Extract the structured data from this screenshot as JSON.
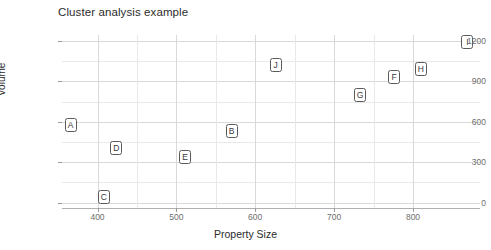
{
  "chart_data": {
    "type": "scatter",
    "title": "Cluster analysis example",
    "xlabel": "Property Size",
    "ylabel": "Volume",
    "xlim": [
      355,
      885
    ],
    "ylim": [
      -40,
      1245
    ],
    "xticks": [
      400,
      500,
      600,
      700,
      800
    ],
    "yticks": [
      0,
      300,
      600,
      900,
      1200
    ],
    "xtick_labels": [
      "400",
      "500",
      "600",
      "700",
      "800"
    ],
    "ytick_labels": [
      "0",
      "300",
      "600",
      "900",
      "1200"
    ],
    "grid": true,
    "legend": "none",
    "marker_style": "boxed-letter",
    "points": [
      {
        "label": "A",
        "x": 366,
        "y": 575
      },
      {
        "label": "B",
        "x": 570,
        "y": 534
      },
      {
        "label": "C",
        "x": 408,
        "y": 42
      },
      {
        "label": "D",
        "x": 424,
        "y": 409
      },
      {
        "label": "E",
        "x": 511,
        "y": 340
      },
      {
        "label": "F",
        "x": 776,
        "y": 930
      },
      {
        "label": "G",
        "x": 733,
        "y": 797
      },
      {
        "label": "H",
        "x": 810,
        "y": 992
      },
      {
        "label": "I",
        "x": 869,
        "y": 1193
      },
      {
        "label": "J",
        "x": 626,
        "y": 1026
      }
    ]
  },
  "colors": {
    "background": "#ffffff",
    "grid": "#d9d9d9",
    "grid_minor": "#e9e9e9",
    "axis": "#b0b0b0",
    "text": "#2b2b2b",
    "tick_text": "#6e6e6e",
    "marker_border": "#5a5a5a"
  }
}
